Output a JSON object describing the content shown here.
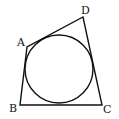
{
  "diagram": {
    "type": "quadrilateral-with-inscribed-circle",
    "stroke_color": "#111111",
    "background": "#ffffff",
    "vertices": {
      "A": {
        "x": 27,
        "y": 47
      },
      "B": {
        "x": 20,
        "y": 105
      },
      "C": {
        "x": 102,
        "y": 105
      },
      "D": {
        "x": 83,
        "y": 17
      }
    },
    "labels": {
      "A": "A",
      "B": "B",
      "C": "C",
      "D": "D"
    },
    "circle": {
      "cx": 59,
      "cy": 69,
      "r": 34
    }
  }
}
